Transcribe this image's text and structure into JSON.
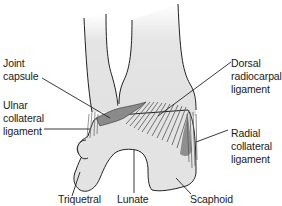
{
  "figure": {
    "colors": {
      "bone_fill": "#e6e6e6",
      "bone_shade": "#d2d2d2",
      "ligament_dark": "#8a8a8a",
      "outline": "#222222",
      "text": "#1a1a1a"
    }
  },
  "labels": {
    "joint_capsule": "Joint\ncapsule",
    "ulnar_collateral_ligament": "Ulnar\ncollateral\nligament",
    "dorsal_radiocarpal_ligament": "Dorsal\nradiocarpal\nligament",
    "radial_collateral_ligament": "Radial\ncollateral\nligament",
    "triquetral": "Triquetral",
    "lunate": "Lunate",
    "scaphoid": "Scaphoid"
  }
}
